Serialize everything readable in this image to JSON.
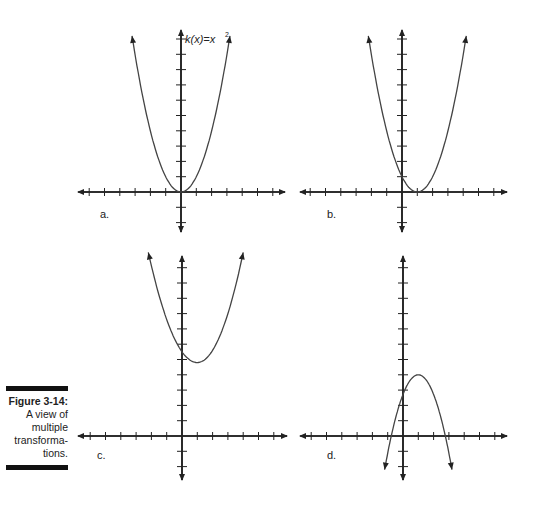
{
  "figure": {
    "title": "Figure 3-14:",
    "description_lines": [
      "A view of",
      "multiple",
      "transforma-",
      "tions."
    ]
  },
  "panels": [
    {
      "label": "a.",
      "annotation": "k(x)=x",
      "annotation_sup": "2"
    },
    {
      "label": "b."
    },
    {
      "label": "c."
    },
    {
      "label": "d."
    }
  ],
  "colors": {
    "axis": "#222222",
    "curve": "#444444",
    "bar": "#111111"
  },
  "chart_data": [
    {
      "type": "line",
      "panel": "a",
      "title": "k(x)=x^2",
      "series": [
        {
          "name": "k(x)=x^2",
          "vertex": [
            0,
            0
          ],
          "x": [
            -3.2,
            -2,
            -1,
            0,
            1,
            2,
            3.2
          ],
          "y": [
            10.2,
            4,
            1,
            0,
            1,
            4,
            10.2
          ]
        }
      ],
      "xlim": [
        -7,
        7
      ],
      "ylim": [
        -3,
        10
      ],
      "grid": false
    },
    {
      "type": "line",
      "panel": "b",
      "series": [
        {
          "name": "(x-1)^2",
          "vertex": [
            1,
            0
          ],
          "x": [
            -2.2,
            -1,
            0,
            1,
            2,
            3,
            4.2
          ],
          "y": [
            10.2,
            4,
            1,
            0,
            1,
            4,
            10.2
          ]
        }
      ],
      "xlim": [
        -7,
        7
      ],
      "ylim": [
        -3,
        10
      ],
      "grid": false
    },
    {
      "type": "line",
      "panel": "c",
      "series": [
        {
          "name": "shifted up",
          "vertex": [
            1,
            4.8
          ],
          "x": [
            -2.2,
            -1,
            0,
            1,
            2,
            3,
            4
          ],
          "y": [
            12,
            7.5,
            5.6,
            4.8,
            5.6,
            7.5,
            12
          ]
        }
      ],
      "xlim": [
        -7,
        7
      ],
      "ylim": [
        -3,
        12
      ],
      "grid": false
    },
    {
      "type": "line",
      "panel": "d",
      "series": [
        {
          "name": "reflected",
          "vertex": [
            1,
            4
          ],
          "x": [
            -1.2,
            -0.9,
            0,
            1,
            2,
            3,
            3.2
          ],
          "y": [
            -2.2,
            0,
            3,
            4,
            3,
            0,
            -2.2
          ]
        }
      ],
      "xlim": [
        -7,
        7
      ],
      "ylim": [
        -3,
        12
      ],
      "grid": false
    }
  ]
}
